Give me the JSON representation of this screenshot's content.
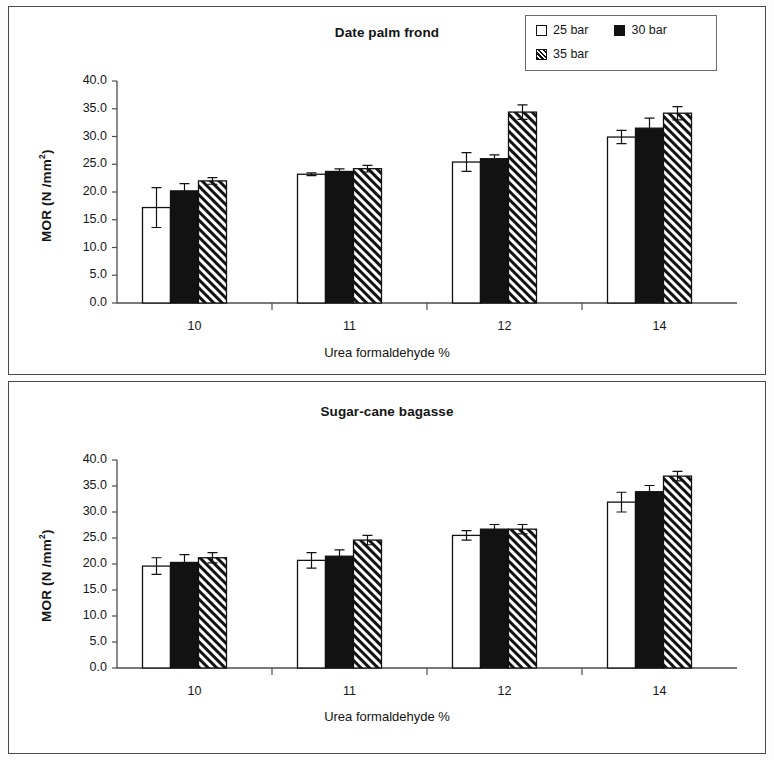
{
  "legend": {
    "entries": [
      {
        "label": "25 bar",
        "style": "white"
      },
      {
        "label": "30 bar",
        "style": "black"
      },
      {
        "label": "35 bar",
        "style": "hatch"
      }
    ]
  },
  "panels": [
    {
      "title": "Date palm frond"
    },
    {
      "title": "Sugar-cane bagasse"
    }
  ],
  "axes": {
    "ylabel_text": "MOR  (N /mm",
    "ylabel_sup": "2",
    "ylabel_tail": ")",
    "xlabel": "Urea formaldehyde %",
    "yticks": [
      "0.0",
      "5.0",
      "10.0",
      "15.0",
      "20.0",
      "25.0",
      "30.0",
      "35.0",
      "40.0"
    ],
    "categories": [
      "10",
      "11",
      "12",
      "14"
    ]
  },
  "chart_data": [
    {
      "type": "bar",
      "title": "Date palm frond",
      "xlabel": "Urea formaldehyde %",
      "ylabel": "MOR  (N /mm2)",
      "categories": [
        "10",
        "11",
        "12",
        "14"
      ],
      "ylim": [
        0,
        40
      ],
      "ytick_step": 5,
      "grid": false,
      "legend_position": "top-right",
      "series": [
        {
          "name": "25 bar",
          "values": [
            17.2,
            23.2,
            25.4,
            29.9
          ],
          "errors": [
            3.6,
            0.25,
            1.7,
            1.2
          ]
        },
        {
          "name": "30 bar",
          "values": [
            20.2,
            23.7,
            26.0,
            31.5
          ],
          "errors": [
            1.3,
            0.45,
            0.7,
            1.8
          ]
        },
        {
          "name": "35 bar",
          "values": [
            22.0,
            24.2,
            34.4,
            34.2
          ],
          "errors": [
            0.6,
            0.6,
            1.3,
            1.2
          ]
        }
      ]
    },
    {
      "type": "bar",
      "title": "Sugar-cane bagasse",
      "xlabel": "Urea formaldehyde %",
      "ylabel": "MOR  (N /mm2)",
      "categories": [
        "10",
        "11",
        "12",
        "14"
      ],
      "ylim": [
        0,
        40
      ],
      "ytick_step": 5,
      "grid": false,
      "legend_position": "none",
      "series": [
        {
          "name": "25 bar",
          "values": [
            19.6,
            20.7,
            25.5,
            31.9
          ],
          "errors": [
            1.6,
            1.5,
            0.9,
            1.9
          ]
        },
        {
          "name": "30 bar",
          "values": [
            20.3,
            21.5,
            26.7,
            33.9
          ],
          "errors": [
            1.5,
            1.2,
            0.9,
            1.2
          ]
        },
        {
          "name": "35 bar",
          "values": [
            21.2,
            24.6,
            26.7,
            36.9
          ],
          "errors": [
            1.0,
            0.9,
            0.9,
            0.9
          ]
        }
      ]
    }
  ]
}
